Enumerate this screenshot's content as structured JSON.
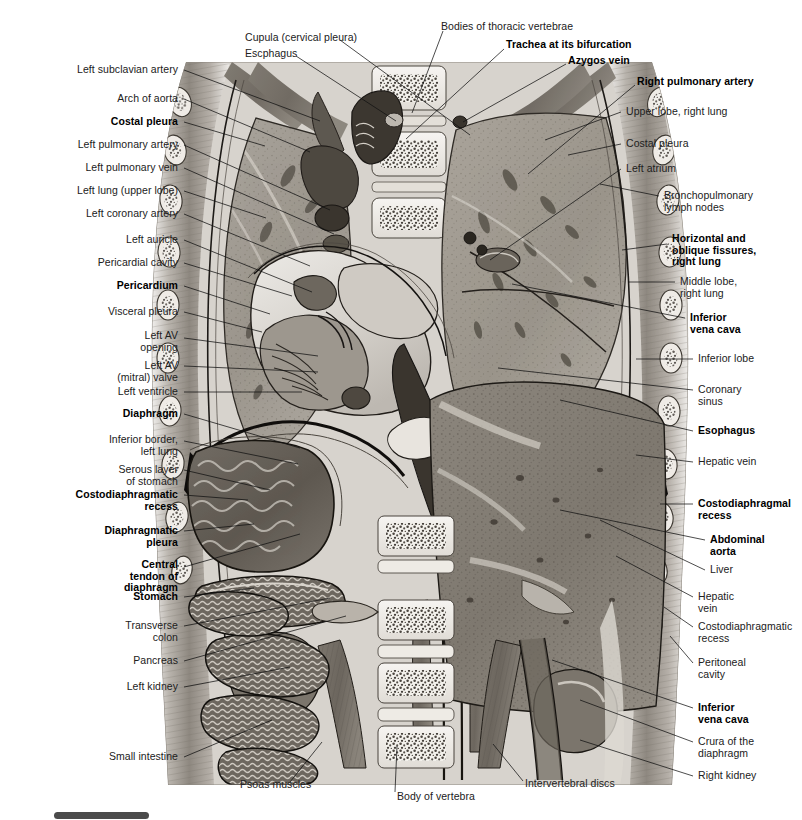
{
  "figure": {
    "background_color": "#ffffff",
    "ink_color": "#212121",
    "artwork_bounds": {
      "x": 145,
      "y": 62,
      "width": 545,
      "height": 723
    },
    "bottom_bar_color": "#4b4b4b"
  },
  "labels": {
    "top": [
      {
        "text": "Cupula (cervical pleura)",
        "bold": false,
        "x": 245,
        "y": 38,
        "align": "c",
        "leader": [
          [
            340,
            40
          ],
          [
            470,
            135
          ]
        ]
      },
      {
        "text": "Escphagus",
        "bold": false,
        "x": 245,
        "y": 54,
        "align": "c",
        "leader": [
          [
            296,
            56
          ],
          [
            396,
            121
          ]
        ]
      },
      {
        "text": "Bodies of thoracic vertebrae",
        "bold": false,
        "x": 441,
        "y": 27,
        "align": "c",
        "leader": [
          [
            443,
            31
          ],
          [
            412,
            113
          ]
        ]
      },
      {
        "text": "Trachea at its bifurcation",
        "bold": true,
        "x": 506,
        "y": 45,
        "align": "c",
        "leader": [
          [
            504,
            49
          ],
          [
            406,
            139
          ]
        ]
      },
      {
        "text": "Azygos vein",
        "bold": true,
        "x": 568,
        "y": 61,
        "align": "c",
        "leader": [
          [
            566,
            64
          ],
          [
            463,
            122
          ]
        ]
      },
      {
        "text": "Right pulmonary artery",
        "bold": true,
        "x": 637,
        "y": 82,
        "align": "c",
        "leader": [
          [
            635,
            85
          ],
          [
            528,
            174
          ]
        ]
      }
    ],
    "left": [
      {
        "text": "Left subclavian artery",
        "bold": false,
        "x": 178,
        "y": 70,
        "align": "l",
        "leader": [
          [
            184,
            70
          ],
          [
            320,
            121
          ]
        ]
      },
      {
        "text": "Arch of aorta",
        "bold": false,
        "x": 178,
        "y": 99,
        "align": "l",
        "leader": [
          [
            184,
            99
          ],
          [
            310,
            152
          ]
        ]
      },
      {
        "text": "Costal pleura",
        "bold": true,
        "x": 178,
        "y": 122,
        "align": "l",
        "leader": [
          [
            184,
            122
          ],
          [
            265,
            146
          ]
        ]
      },
      {
        "text": "Left pulmonary artery",
        "bold": false,
        "x": 178,
        "y": 145,
        "align": "l",
        "leader": [
          [
            184,
            145
          ],
          [
            330,
            210
          ]
        ]
      },
      {
        "text": "Left pulmonary vein",
        "bold": false,
        "x": 178,
        "y": 168,
        "align": "l",
        "leader": [
          [
            184,
            168
          ],
          [
            334,
            234
          ]
        ]
      },
      {
        "text": "Left lung (upper lobe)",
        "bold": false,
        "x": 178,
        "y": 191,
        "align": "l",
        "leader": [
          [
            184,
            191
          ],
          [
            266,
            218
          ]
        ]
      },
      {
        "text": "Left coronary artery",
        "bold": false,
        "x": 178,
        "y": 214,
        "align": "l",
        "leader": [
          [
            184,
            214
          ],
          [
            310,
            266
          ]
        ]
      },
      {
        "text": "Left auricle",
        "bold": false,
        "x": 178,
        "y": 240,
        "align": "l",
        "leader": [
          [
            184,
            240
          ],
          [
            312,
            292
          ]
        ]
      },
      {
        "text": "Pericardial cavity",
        "bold": false,
        "x": 178,
        "y": 263,
        "align": "l",
        "leader": [
          [
            184,
            263
          ],
          [
            292,
            296
          ]
        ]
      },
      {
        "text": "Pericardium",
        "bold": true,
        "x": 178,
        "y": 286,
        "align": "l",
        "leader": [
          [
            184,
            286
          ],
          [
            270,
            314
          ]
        ]
      },
      {
        "text": "Visceral pleura",
        "bold": false,
        "x": 178,
        "y": 312,
        "align": "l",
        "leader": [
          [
            184,
            312
          ],
          [
            262,
            332
          ]
        ]
      },
      {
        "text": "Left AV\nopening",
        "bold": false,
        "x": 178,
        "y": 342,
        "align": "l",
        "leader": [
          [
            184,
            338
          ],
          [
            318,
            356
          ]
        ]
      },
      {
        "text": "Left AV\n(mitral) valve",
        "bold": false,
        "x": 178,
        "y": 372,
        "align": "l",
        "leader": [
          [
            184,
            366
          ],
          [
            318,
            372
          ]
        ]
      },
      {
        "text": "Left ventricle",
        "bold": false,
        "x": 178,
        "y": 392,
        "align": "l",
        "leader": [
          [
            184,
            392
          ],
          [
            302,
            392
          ]
        ]
      },
      {
        "text": "Diaphragm",
        "bold": true,
        "x": 178,
        "y": 414,
        "align": "l",
        "leader": [
          [
            184,
            414
          ],
          [
            300,
            448
          ]
        ]
      },
      {
        "text": "Inferior border,\nleft lung",
        "bold": false,
        "x": 178,
        "y": 446,
        "align": "l",
        "leader": [
          [
            184,
            441
          ],
          [
            298,
            464
          ]
        ]
      },
      {
        "text": "Serous layer\nof stomach",
        "bold": false,
        "x": 178,
        "y": 476,
        "align": "l",
        "leader": [
          [
            184,
            470
          ],
          [
            270,
            490
          ]
        ]
      },
      {
        "text": "Costodiaphragmatic\nrecess",
        "bold": true,
        "x": 178,
        "y": 501,
        "align": "l",
        "leader": [
          [
            184,
            495
          ],
          [
            248,
            500
          ]
        ]
      },
      {
        "text": "Diaphragmatic\npleura",
        "bold": true,
        "x": 178,
        "y": 537,
        "align": "l",
        "leader": [
          [
            184,
            531
          ],
          [
            254,
            524
          ]
        ]
      },
      {
        "text": "Central\ntendon of\ndiaphragm",
        "bold": true,
        "x": 178,
        "y": 576,
        "align": "l",
        "leader": [
          [
            184,
            567
          ],
          [
            300,
            534
          ]
        ]
      },
      {
        "text": "Stomach",
        "bold": true,
        "x": 178,
        "y": 597,
        "align": "l",
        "leader": [
          [
            184,
            597
          ],
          [
            254,
            588
          ]
        ]
      },
      {
        "text": "Transverse\ncolon",
        "bold": false,
        "x": 178,
        "y": 632,
        "align": "l",
        "leader": [
          [
            184,
            626
          ],
          [
            330,
            598
          ]
        ]
      },
      {
        "text": "Pancreas",
        "bold": false,
        "x": 178,
        "y": 661,
        "align": "l",
        "leader": [
          [
            184,
            661
          ],
          [
            346,
            616
          ]
        ]
      },
      {
        "text": "Left kidney",
        "bold": false,
        "x": 178,
        "y": 687,
        "align": "l",
        "leader": [
          [
            184,
            687
          ],
          [
            290,
            667
          ]
        ]
      },
      {
        "text": "Small intestine",
        "bold": false,
        "x": 178,
        "y": 757,
        "align": "l",
        "leader": [
          [
            184,
            757
          ],
          [
            272,
            720
          ]
        ]
      }
    ],
    "right": [
      {
        "text": "Upper lobe, right lung",
        "bold": false,
        "x": 626,
        "y": 112,
        "align": "r",
        "leader": [
          [
            621,
            112
          ],
          [
            545,
            140
          ]
        ]
      },
      {
        "text": "Costal pleura",
        "bold": false,
        "x": 626,
        "y": 144,
        "align": "r",
        "leader": [
          [
            621,
            144
          ],
          [
            568,
            155
          ]
        ]
      },
      {
        "text": "Left atrium",
        "bold": false,
        "x": 626,
        "y": 169,
        "align": "r",
        "leader": [
          [
            621,
            169
          ],
          [
            490,
            260
          ]
        ]
      },
      {
        "text": "Bronchopulmonary\nlymph nodes",
        "bold": false,
        "x": 664,
        "y": 202,
        "align": "r",
        "leader": [
          [
            659,
            196
          ],
          [
            600,
            184
          ]
        ]
      },
      {
        "text": "Horizontal and\noblique fissures,\nright lung",
        "bold": true,
        "x": 672,
        "y": 250,
        "align": "r",
        "leader": [
          [
            667,
            244
          ],
          [
            622,
            250
          ]
        ]
      },
      {
        "text": "Middle lobe,\nright lung",
        "bold": false,
        "x": 680,
        "y": 288,
        "align": "r",
        "leader": [
          [
            675,
            282
          ],
          [
            628,
            282
          ]
        ]
      },
      {
        "text": "Inferior\nvena cava",
        "bold": true,
        "x": 690,
        "y": 324,
        "align": "r",
        "leader": [
          [
            685,
            318
          ],
          [
            512,
            284
          ]
        ]
      },
      {
        "text": "Inferior lobe",
        "bold": false,
        "x": 698,
        "y": 359,
        "align": "r",
        "leader": [
          [
            693,
            359
          ],
          [
            636,
            359
          ]
        ]
      },
      {
        "text": "Coronary\nsinus",
        "bold": false,
        "x": 698,
        "y": 396,
        "align": "r",
        "leader": [
          [
            693,
            390
          ],
          [
            498,
            368
          ]
        ]
      },
      {
        "text": "Esophagus",
        "bold": true,
        "x": 698,
        "y": 431,
        "align": "r",
        "leader": [
          [
            693,
            431
          ],
          [
            560,
            400
          ]
        ]
      },
      {
        "text": "Hepatic vein",
        "bold": false,
        "x": 698,
        "y": 462,
        "align": "r",
        "leader": [
          [
            693,
            462
          ],
          [
            636,
            455
          ]
        ]
      },
      {
        "text": "Costodiaphragmal\nrecess",
        "bold": true,
        "x": 698,
        "y": 510,
        "align": "r",
        "leader": [
          [
            693,
            504
          ],
          [
            660,
            504
          ]
        ]
      },
      {
        "text": "Abdominal\naorta",
        "bold": true,
        "x": 710,
        "y": 546,
        "align": "r",
        "leader": [
          [
            705,
            540
          ],
          [
            560,
            510
          ]
        ]
      },
      {
        "text": "Liver",
        "bold": false,
        "x": 710,
        "y": 570,
        "align": "r",
        "leader": [
          [
            705,
            570
          ],
          [
            600,
            520
          ]
        ]
      },
      {
        "text": "Hepatic\nvein",
        "bold": false,
        "x": 698,
        "y": 603,
        "align": "r",
        "leader": [
          [
            693,
            597
          ],
          [
            616,
            556
          ]
        ]
      },
      {
        "text": "Costodiaphragmatic\nrecess",
        "bold": false,
        "x": 698,
        "y": 633,
        "align": "r",
        "leader": [
          [
            693,
            627
          ],
          [
            664,
            607
          ]
        ]
      },
      {
        "text": "Peritoneal\ncavity",
        "bold": false,
        "x": 698,
        "y": 669,
        "align": "r",
        "leader": [
          [
            693,
            663
          ],
          [
            670,
            636
          ]
        ]
      },
      {
        "text": "Inferior\nvena cava",
        "bold": true,
        "x": 698,
        "y": 714,
        "align": "r",
        "leader": [
          [
            693,
            708
          ],
          [
            552,
            660
          ]
        ]
      },
      {
        "text": "Crura of the\ndiaphragm",
        "bold": false,
        "x": 698,
        "y": 748,
        "align": "r",
        "leader": [
          [
            693,
            742
          ],
          [
            580,
            700
          ]
        ]
      },
      {
        "text": "Right kidney",
        "bold": false,
        "x": 698,
        "y": 776,
        "align": "r",
        "leader": [
          [
            693,
            776
          ],
          [
            580,
            740
          ]
        ]
      }
    ],
    "bottom": [
      {
        "text": "Psoas muscles",
        "bold": false,
        "x": 240,
        "y": 785,
        "align": "c",
        "leader": [
          [
            290,
            782
          ],
          [
            322,
            742
          ]
        ]
      },
      {
        "text": "Body of vertebra",
        "bold": false,
        "x": 397,
        "y": 797,
        "align": "c",
        "leader": [
          [
            395,
            792
          ],
          [
            397,
            746
          ]
        ]
      },
      {
        "text": "Intervertebral discs",
        "bold": false,
        "x": 525,
        "y": 784,
        "align": "c",
        "leader": [
          [
            523,
            781
          ],
          [
            493,
            744
          ]
        ]
      }
    ]
  }
}
